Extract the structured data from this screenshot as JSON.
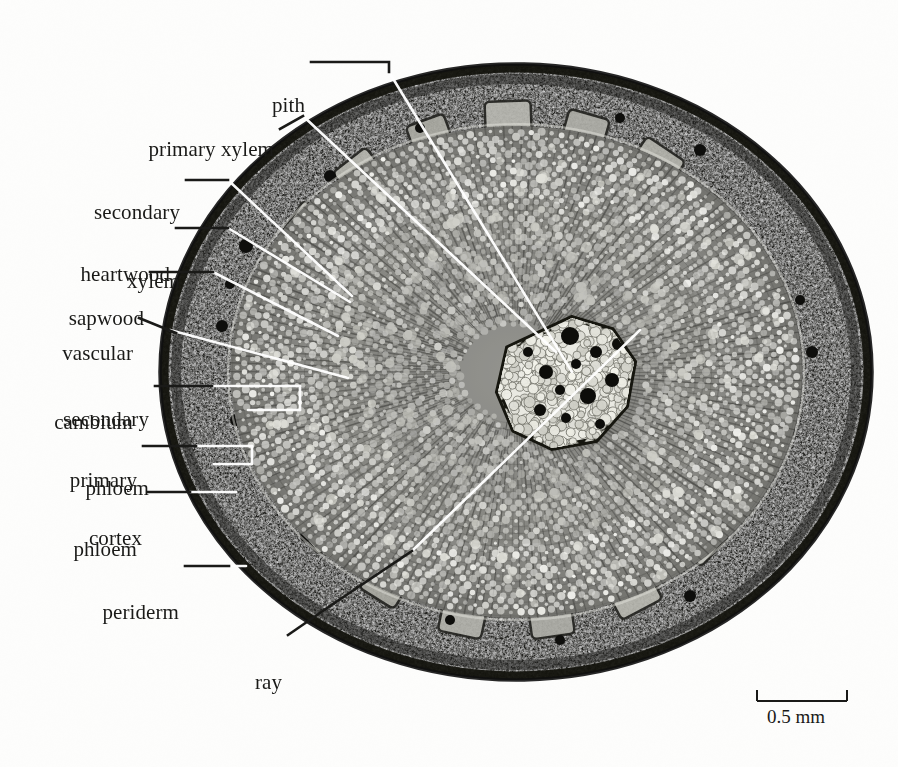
{
  "figure": {
    "specimen": "transverse section of a young woody stem",
    "background_color": "#fdfdfc",
    "ink_color": "#1a1a18",
    "leader_light_color": "#ffffff",
    "top_rule": true
  },
  "labels": [
    {
      "id": "pith",
      "text": "pith",
      "lines": [
        "pith"
      ]
    },
    {
      "id": "primary-xylem",
      "text": "primary xylem",
      "lines": [
        "primary xylem"
      ]
    },
    {
      "id": "secondary-xylem",
      "text": "secondary xylem",
      "lines": [
        "secondary",
        "xylem"
      ]
    },
    {
      "id": "heartwood",
      "text": "heartwood",
      "lines": [
        "heartwood"
      ]
    },
    {
      "id": "sapwood",
      "text": "sapwood",
      "lines": [
        "sapwood"
      ]
    },
    {
      "id": "vascular-cambium",
      "text": "vascular cambium",
      "lines": [
        "vascular",
        "cambium"
      ]
    },
    {
      "id": "secondary-phloem",
      "text": "secondary phloem",
      "lines": [
        "secondary",
        "phloem"
      ]
    },
    {
      "id": "primary-phloem",
      "text": "primary phloem",
      "lines": [
        "primary",
        "phloem"
      ]
    },
    {
      "id": "cortex",
      "text": "cortex",
      "lines": [
        "cortex"
      ]
    },
    {
      "id": "periderm",
      "text": "periderm",
      "lines": [
        "periderm"
      ]
    },
    {
      "id": "ray",
      "text": "ray",
      "lines": [
        "ray"
      ]
    }
  ],
  "scale_bar": {
    "label": "0.5 mm",
    "value": 0.5,
    "unit": "mm",
    "bar_length_px": 90
  }
}
